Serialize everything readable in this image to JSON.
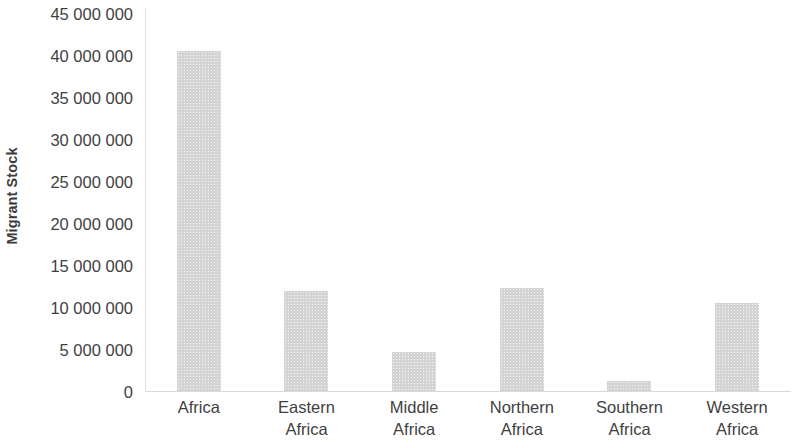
{
  "chart_data": {
    "type": "bar",
    "title": "",
    "subtitle": "",
    "xlabel": "",
    "ylabel": "Migrant Stock",
    "categories": [
      "Africa",
      "Eastern Africa",
      "Middle Africa",
      "Northern Africa",
      "Southern Africa",
      "Western Africa"
    ],
    "values": [
      40500000,
      11900000,
      4600000,
      12300000,
      1200000,
      10500000
    ],
    "ylim": [
      0,
      45000000
    ],
    "ytick_values": [
      0,
      5000000,
      10000000,
      15000000,
      20000000,
      25000000,
      30000000,
      35000000,
      40000000,
      45000000
    ],
    "ytick_labels": [
      "0",
      "5 000 000",
      "10 000 000",
      "15 000 000",
      "20 000 000",
      "25 000 000",
      "30 000 000",
      "35 000 000",
      "40 000 000",
      "45 000 000"
    ],
    "grid": false,
    "legend": null,
    "bar_color": "#d4d4d4",
    "axis_color": "#d9d9d9",
    "text_color": "#3f3f3f"
  },
  "axis": {
    "y_title": "Migrant Stock"
  },
  "categories_wrapped": [
    [
      "Africa"
    ],
    [
      "Eastern",
      "Africa"
    ],
    [
      "Middle",
      "Africa"
    ],
    [
      "Northern",
      "Africa"
    ],
    [
      "Southern",
      "Africa"
    ],
    [
      "Western",
      "Africa"
    ]
  ]
}
